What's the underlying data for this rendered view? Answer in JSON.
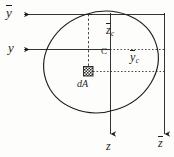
{
  "figure": {
    "ink_color": "#1d1d1d",
    "background": "#fdfdfc"
  },
  "labels": {
    "y_bar_axis": "y",
    "y_axis": "y",
    "z_bar_c": "z",
    "z_bar_c_sub": "c",
    "centroid": "C",
    "y_bar_c": "y",
    "y_bar_c_sub": "c",
    "differential_area": "dA",
    "z_axis": "z",
    "z_bar_axis": "z"
  },
  "geometry": {
    "shape": "ellipse",
    "ellipse_center_x": 101,
    "ellipse_center_y": 62,
    "ellipse_rx": 58,
    "ellipse_ry": 50,
    "ellipse_rotation_deg": -18,
    "centroid_x": 110,
    "centroid_y": 49,
    "da_x": 88,
    "da_y": 71,
    "da_size": 9,
    "ybar_axis_y": 14,
    "y_axis_y": 49,
    "z_axis_x": 110,
    "zbar_axis_x": 164,
    "arrow_left_x": 22,
    "arrow_bottom_y": 136
  }
}
